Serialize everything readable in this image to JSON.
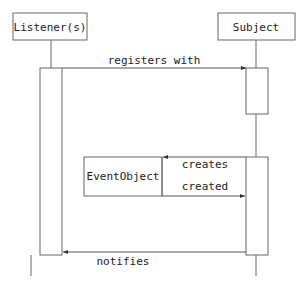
{
  "diagram": {
    "type": "sequence",
    "participants": [
      {
        "id": "listener",
        "label": "Listener(s)"
      },
      {
        "id": "subject",
        "label": "Subject"
      }
    ],
    "object": {
      "label": "EventObject"
    },
    "messages": [
      {
        "from": "listener",
        "to": "subject",
        "label": "registers with"
      },
      {
        "from": "subject",
        "to": "eventobject",
        "label": "creates"
      },
      {
        "from": "eventobject",
        "to": "subject",
        "label": "created"
      },
      {
        "from": "subject",
        "to": "listener",
        "label": "notifies"
      }
    ],
    "colors": {
      "line": "#555555",
      "text": "#222222",
      "background": "#ffffff"
    }
  }
}
